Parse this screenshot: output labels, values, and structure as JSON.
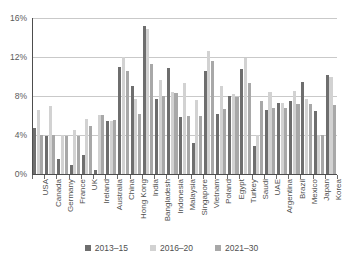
{
  "chart_data": {
    "type": "bar",
    "title": "",
    "subtitle": "",
    "xlabel": "",
    "ylabel": "",
    "ylim": [
      0,
      16
    ],
    "ytick_labels": [
      "0%",
      "4%",
      "8%",
      "12%",
      "16%"
    ],
    "ytick_values": [
      0,
      4,
      8,
      12,
      16
    ],
    "grid": "horizontal",
    "legend_position": "bottom",
    "value_unit": "%",
    "categories": [
      "USA",
      "Canada",
      "Germany",
      "France",
      "UK",
      "Ireland",
      "Australia",
      "China",
      "Hong Kong",
      "India",
      "Bangladesh",
      "Indonesia",
      "Malaysia",
      "Singapore",
      "Vietnam",
      "Poland",
      "Egypt",
      "Turkey",
      "Saudi",
      "UAE",
      "Argentina",
      "Brazil",
      "Mexico",
      "Japan",
      "Korea"
    ],
    "series": [
      {
        "name": "2013–15",
        "color": "#6e6e6e",
        "values": [
          4.7,
          3.9,
          1.5,
          0.9,
          1.9,
          0.4,
          5.4,
          11.0,
          9.0,
          15.2,
          7.7,
          10.9,
          5.8,
          3.2,
          10.6,
          6.2,
          8.0,
          10.8,
          2.9,
          6.6,
          7.3,
          7.5,
          9.4,
          6.5,
          10.2
        ]
      },
      {
        "name": "2016–20",
        "color": "#d2d2d2",
        "values": [
          6.6,
          7.0,
          4.0,
          4.5,
          5.6,
          6.1,
          5.4,
          12.0,
          7.7,
          14.9,
          9.6,
          8.4,
          9.3,
          7.6,
          12.6,
          9.0,
          8.2,
          11.9,
          4.0,
          8.4,
          7.3,
          8.5,
          7.7,
          4.0,
          9.9
        ]
      },
      {
        "name": "2021–30",
        "color": "#a8a8a8",
        "values": [
          4.0,
          4.0,
          3.9,
          3.9,
          4.9,
          6.1,
          5.5,
          10.6,
          6.2,
          11.3,
          8.0,
          8.3,
          6.0,
          6.0,
          11.6,
          6.7,
          7.9,
          9.3,
          7.5,
          6.8,
          6.8,
          7.2,
          7.2,
          4.0,
          7.1
        ]
      }
    ]
  },
  "legend": {
    "items": [
      {
        "label": "2013–15",
        "color": "#6e6e6e"
      },
      {
        "label": "2016–20",
        "color": "#d2d2d2"
      },
      {
        "label": "2021–30",
        "color": "#a8a8a8"
      }
    ]
  }
}
